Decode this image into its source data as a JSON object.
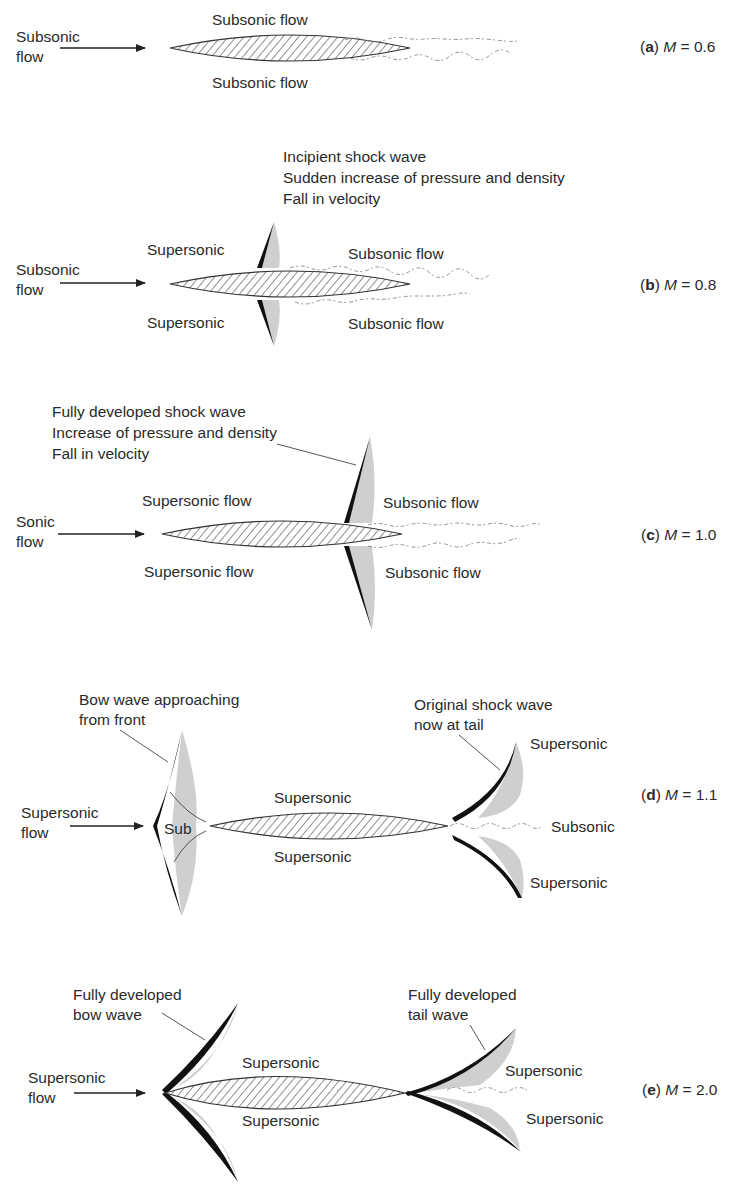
{
  "figure": {
    "panels": [
      {
        "id": "a",
        "letter": "a",
        "mach": "0.6",
        "inflow_line1": "Subsonic",
        "inflow_line2": "flow",
        "upper_label": "Subsonic flow",
        "lower_label": "Subsonic flow"
      },
      {
        "id": "b",
        "letter": "b",
        "mach": "0.8",
        "inflow_line1": "Subsonic",
        "inflow_line2": "flow",
        "note_line1": "Incipient shock wave",
        "note_line2": "Sudden increase of pressure and density",
        "note_line3": "Fall in velocity",
        "upper_front": "Supersonic",
        "lower_front": "Supersonic",
        "upper_rear": "Subsonic flow",
        "lower_rear": "Subsonic flow"
      },
      {
        "id": "c",
        "letter": "c",
        "mach": "1.0",
        "inflow_line1": "Sonic",
        "inflow_line2": "flow",
        "note_line1": "Fully developed shock wave",
        "note_line2": "Increase of pressure and density",
        "note_line3": "Fall in velocity",
        "upper_front": "Supersonic flow",
        "lower_front": "Supersonic flow",
        "upper_rear": "Subsonic flow",
        "lower_rear": "Subsonic flow"
      },
      {
        "id": "d",
        "letter": "d",
        "mach": "1.1",
        "inflow_line1": "Supersonic",
        "inflow_line2": "flow",
        "bow_note_line1": "Bow wave approaching",
        "bow_note_line2": "from front",
        "tail_note_line1": "Original shock wave",
        "tail_note_line2": "now at tail",
        "sub_label": "Sub",
        "upper_mid": "Supersonic",
        "lower_mid": "Supersonic",
        "tail_upper": "Supersonic",
        "tail_mid": "Subsonic",
        "tail_lower": "Supersonic"
      },
      {
        "id": "e",
        "letter": "e",
        "mach": "2.0",
        "inflow_line1": "Supersonic",
        "inflow_line2": "flow",
        "bow_note_line1": "Fully developed",
        "bow_note_line2": "bow wave",
        "tail_note_line1": "Fully developed",
        "tail_note_line2": "tail wave",
        "upper_mid": "Supersonic",
        "lower_mid": "Supersonic",
        "tail_upper": "Supersonic",
        "tail_lower": "Supersonic"
      }
    ],
    "mach_symbol": "M",
    "equals": "=",
    "colors": {
      "ink": "#2a2a2a",
      "shock": "#111111",
      "shade": "#cfcfcf",
      "wake": "#8a8a8a"
    }
  }
}
